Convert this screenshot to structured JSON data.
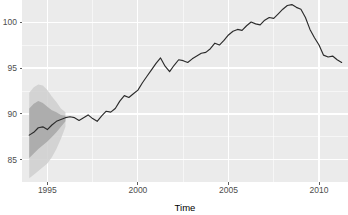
{
  "chart_data": {
    "type": "line",
    "title": "",
    "subtitle": "",
    "xlabel": "Time",
    "ylabel": "",
    "grid": true,
    "legend": "none",
    "xlim": [
      1993.6,
      2011.6
    ],
    "ylim": [
      82.6,
      102.4
    ],
    "x_ticks": [
      1995,
      2000,
      2005,
      2010
    ],
    "x_tick_labels": [
      "1995",
      "2000",
      "2005",
      "2010"
    ],
    "y_ticks": [
      85,
      90,
      95,
      100
    ],
    "y_tick_labels": [
      "85",
      "90",
      "95",
      "100"
    ],
    "x_minor_ticks": [
      1997.5,
      2002.5,
      2007.5
    ],
    "y_minor_ticks": [
      87.5,
      92.5,
      97.5,
      102.5
    ],
    "series": [
      {
        "name": "observed",
        "x": [
          1994.0,
          1994.25,
          1994.5,
          1994.75,
          1995.0,
          1995.25,
          1995.5,
          1995.75,
          1996.0,
          1996.25,
          1996.5,
          1996.75,
          1997.0,
          1997.25,
          1997.5,
          1997.75,
          1998.0,
          1998.25,
          1998.5,
          1998.75,
          1999.0,
          1999.25,
          1999.5,
          1999.75,
          2000.0,
          2000.25,
          2000.5,
          2000.75,
          2001.0,
          2001.25,
          2001.5,
          2001.75,
          2002.0,
          2002.25,
          2002.5,
          2002.75,
          2003.0,
          2003.25,
          2003.5,
          2003.75,
          2004.0,
          2004.25,
          2004.5,
          2004.75,
          2005.0,
          2005.25,
          2005.5,
          2005.75,
          2006.0,
          2006.25,
          2006.5,
          2006.75,
          2007.0,
          2007.25,
          2007.5,
          2007.75,
          2008.0,
          2008.25,
          2008.5,
          2008.75,
          2009.0,
          2009.25,
          2009.5,
          2009.75,
          2010.0,
          2010.25,
          2010.5,
          2010.75,
          2011.0,
          2011.25
        ],
        "y": [
          87.7,
          88.0,
          88.5,
          88.6,
          88.3,
          88.8,
          89.2,
          89.4,
          89.6,
          89.7,
          89.6,
          89.3,
          89.6,
          89.9,
          89.5,
          89.2,
          89.8,
          90.3,
          90.2,
          90.6,
          91.4,
          92.0,
          91.8,
          92.2,
          92.6,
          93.4,
          94.1,
          94.8,
          95.5,
          96.1,
          95.2,
          94.6,
          95.3,
          95.9,
          95.8,
          95.6,
          96.0,
          96.3,
          96.6,
          96.7,
          97.1,
          97.7,
          97.5,
          98.0,
          98.6,
          99.0,
          99.2,
          99.1,
          99.6,
          100.0,
          99.8,
          99.7,
          100.2,
          100.5,
          100.4,
          100.9,
          101.4,
          101.8,
          101.9,
          101.6,
          101.4,
          100.5,
          99.2,
          98.3,
          97.5,
          96.4,
          96.2,
          96.3,
          95.9,
          95.6
        ]
      }
    ],
    "uncertainty_bands": [
      {
        "name": "outer-interval",
        "x": [
          1994.0,
          1994.25,
          1994.5,
          1994.75,
          1995.0,
          1995.25,
          1995.5,
          1995.75,
          1996.0
        ],
        "lower": [
          83.0,
          83.4,
          83.8,
          84.2,
          84.6,
          85.3,
          86.2,
          87.3,
          88.6
        ],
        "upper": [
          92.3,
          92.9,
          93.2,
          93.1,
          92.6,
          91.9,
          91.3,
          90.6,
          90.2
        ],
        "color": "#cfcfcf"
      },
      {
        "name": "inner-interval",
        "x": [
          1994.0,
          1994.25,
          1994.5,
          1994.75,
          1995.0,
          1995.25,
          1995.5,
          1995.75,
          1996.0
        ],
        "lower": [
          85.2,
          85.7,
          86.2,
          86.6,
          87.0,
          87.5,
          88.0,
          88.6,
          89.2
        ],
        "upper": [
          90.6,
          91.1,
          91.4,
          91.2,
          90.8,
          90.4,
          90.2,
          89.9,
          89.8
        ],
        "color": "#a9a9a9"
      }
    ],
    "colors": {
      "panel_background": "#ebebeb",
      "grid_major": "#ffffff",
      "grid_minor": "#ffffff",
      "line": "#2b2b2b",
      "band_outer": "#cfcfcf",
      "band_inner": "#a9a9a9",
      "tick_text": "#4d4d4d",
      "axis_title": "#000000"
    }
  }
}
